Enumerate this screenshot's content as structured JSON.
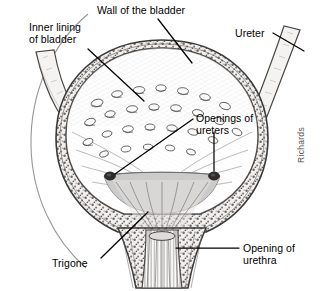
{
  "figure": {
    "signature": "Richards",
    "background_color": "#ffffff",
    "ink_color": "#3a3a3a",
    "fluid_color": "#c9c9c9"
  },
  "labels": {
    "inner_lining": "Inner lining\nof bladder",
    "wall": "Wall of the bladder",
    "ureter": "Ureter",
    "openings": "Openings of\nureters",
    "trigone": "Trigone",
    "urethra": "Opening of\nurethra"
  },
  "structures": [
    {
      "name": "bladder-wall",
      "label": "Wall of the bladder"
    },
    {
      "name": "inner-lining",
      "label": "Inner lining of bladder"
    },
    {
      "name": "ureter-tube-left",
      "label": "Ureter"
    },
    {
      "name": "ureter-tube-right",
      "label": "Ureter"
    },
    {
      "name": "ureter-opening-left",
      "label": "Openings of ureters"
    },
    {
      "name": "ureter-opening-right",
      "label": "Openings of ureters"
    },
    {
      "name": "trigone",
      "label": "Trigone"
    },
    {
      "name": "urethra-opening",
      "label": "Opening of urethra"
    }
  ]
}
